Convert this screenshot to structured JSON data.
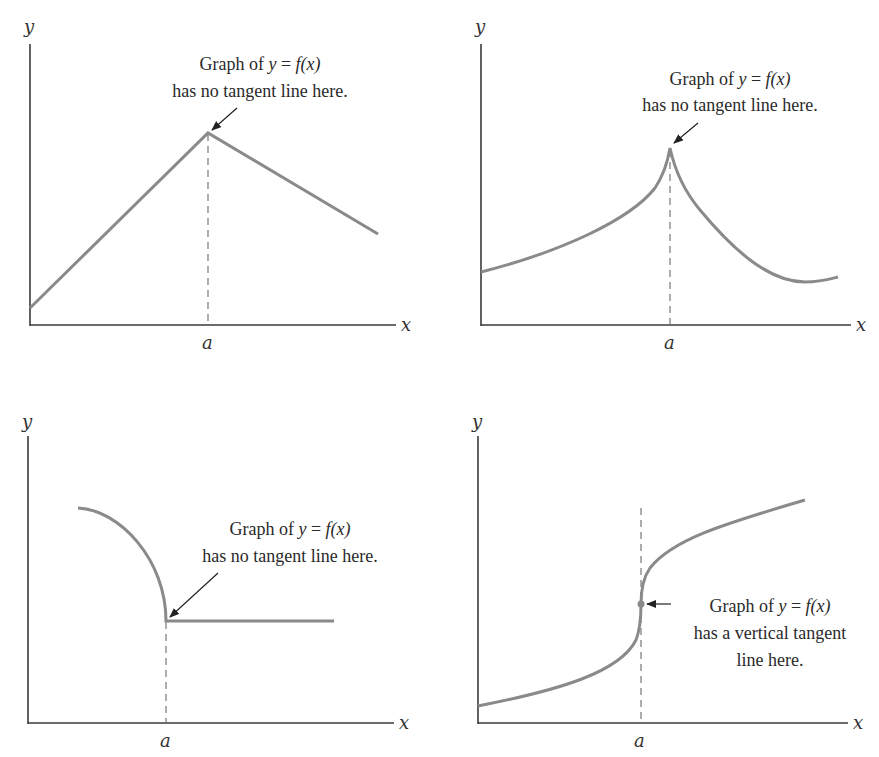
{
  "panels": [
    {
      "id": "corner",
      "axis_labels": {
        "x": "x",
        "y": "y",
        "point": "a"
      },
      "annotation": {
        "line1_prefix": "Graph of ",
        "line1_var": "y",
        "line1_eq": " = ",
        "line1_func": "f(x)",
        "line2": "has no tangent line here."
      },
      "description": "Piecewise linear graph with a corner at x = a"
    },
    {
      "id": "cusp",
      "axis_labels": {
        "x": "x",
        "y": "y",
        "point": "a"
      },
      "annotation": {
        "line1_prefix": "Graph of ",
        "line1_var": "y",
        "line1_eq": " = ",
        "line1_func": "f(x)",
        "line2": "has no tangent line here."
      },
      "description": "Curve with a cusp at x = a"
    },
    {
      "id": "endpoint",
      "axis_labels": {
        "x": "x",
        "y": "y",
        "point": "a"
      },
      "annotation": {
        "line1_prefix": "Graph of ",
        "line1_var": "y",
        "line1_eq": " = ",
        "line1_func": "f(x)",
        "line2": "has no tangent line here."
      },
      "description": "Quarter-circle arc meeting a horizontal segment at x = a"
    },
    {
      "id": "vertical-tangent",
      "axis_labels": {
        "x": "x",
        "y": "y",
        "point": "a"
      },
      "annotation": {
        "line1_prefix": "Graph of ",
        "line1_var": "y",
        "line1_eq": " = ",
        "line1_func": "f(x)",
        "line2": "has a vertical tangent",
        "line3": "line here."
      },
      "description": "Cube-root-like curve with a vertical tangent at x = a"
    }
  ],
  "colors": {
    "curve": "#8a8a8a",
    "axis": "#3a3a3a",
    "text": "#2a2a2a"
  }
}
